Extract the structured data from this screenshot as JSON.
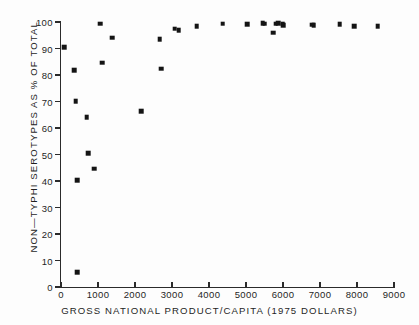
{
  "chart_data": {
    "type": "scatter",
    "title": "",
    "xlabel": "GROSS NATIONAL PRODUCT/CAPITA  (1975  DOLLARS)",
    "ylabel": "NON—TYPHI SEROTYPES AS % OF TOTAL",
    "xlim": [
      0,
      9000
    ],
    "ylim": [
      0,
      100
    ],
    "xticks": [
      0,
      1000,
      2000,
      3000,
      4000,
      5000,
      6000,
      7000,
      8000,
      9000
    ],
    "xtick_labels": [
      "0",
      "1000",
      "2000",
      "3000",
      "4000",
      "5000",
      "6000",
      "7000",
      "8000",
      "9000"
    ],
    "yticks": [
      0,
      10,
      20,
      30,
      40,
      50,
      60,
      70,
      80,
      90,
      100
    ],
    "ytick_labels": [
      "0",
      "10",
      "20",
      "30",
      "40",
      "50",
      "60",
      "70",
      "80",
      "90",
      "100"
    ],
    "grid": false,
    "legend": null,
    "marker": "square",
    "marker_color": "#141414",
    "axis_color": "#2b2b2b",
    "background_color": "#fdfdfd",
    "points": [
      {
        "x": 80,
        "y": 90.5
      },
      {
        "x": 350,
        "y": 81.8
      },
      {
        "x": 400,
        "y": 70.1
      },
      {
        "x": 430,
        "y": 40.3
      },
      {
        "x": 440,
        "y": 5.5
      },
      {
        "x": 700,
        "y": 64.0
      },
      {
        "x": 730,
        "y": 50.4
      },
      {
        "x": 900,
        "y": 44.7
      },
      {
        "x": 1060,
        "y": 99.4
      },
      {
        "x": 1120,
        "y": 84.6
      },
      {
        "x": 1380,
        "y": 94.0
      },
      {
        "x": 2170,
        "y": 66.4
      },
      {
        "x": 2670,
        "y": 93.4
      },
      {
        "x": 2710,
        "y": 82.3
      },
      {
        "x": 3070,
        "y": 97.4
      },
      {
        "x": 3180,
        "y": 96.9
      },
      {
        "x": 3670,
        "y": 98.5
      },
      {
        "x": 4370,
        "y": 99.3
      },
      {
        "x": 5040,
        "y": 99.2
      },
      {
        "x": 5450,
        "y": 99.5
      },
      {
        "x": 5500,
        "y": 99.3
      },
      {
        "x": 5730,
        "y": 96.0
      },
      {
        "x": 5800,
        "y": 99.4
      },
      {
        "x": 5870,
        "y": 99.5
      },
      {
        "x": 5990,
        "y": 99.4
      },
      {
        "x": 6010,
        "y": 98.7
      },
      {
        "x": 6790,
        "y": 99.0
      },
      {
        "x": 6830,
        "y": 98.8
      },
      {
        "x": 7530,
        "y": 99.1
      },
      {
        "x": 7930,
        "y": 98.4
      },
      {
        "x": 8560,
        "y": 98.5
      }
    ]
  }
}
